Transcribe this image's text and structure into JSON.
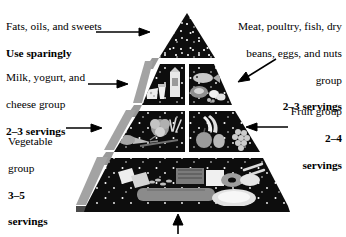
{
  "diagram": {
    "name": "Food Guide Pyramid",
    "tiers": 4,
    "background_color": "#ffffff",
    "pyramid_fill": "#0d0d0d",
    "bevel_color": "#9a9a9a",
    "divider_color": "#ffffff"
  },
  "labels": {
    "fats": {
      "line1": "Fats, oils, and sweets",
      "line2": "Use sparingly",
      "arrow": "arrow-right"
    },
    "milk": {
      "line1": "Milk, yogurt, and",
      "line2": "cheese group",
      "line3": "2–3 servings",
      "arrow": "arrow-right"
    },
    "vegetable": {
      "line1": "Vegetable",
      "line2": "group",
      "line3": "3–5",
      "line4": "servings",
      "arrow": "arrow-right"
    },
    "meat": {
      "line1": "Meat, poultry, fish, dry",
      "line2": "beans, eggs, and nuts",
      "line3": "group",
      "line4": "2–3 servings",
      "arrow": "arrow-diagonal-down-left"
    },
    "fruit": {
      "line1": "Fruit group",
      "line2": "2–4",
      "line3": "servings",
      "arrow": "arrow-left"
    },
    "base": {
      "arrow": "arrow-up"
    }
  },
  "tier_contents": {
    "apex": "fats-oils-sweets",
    "tier2_left": "milk-yogurt-cheese",
    "tier2_right": "meat-poultry-fish-beans-eggs-nuts",
    "tier3_left": "vegetables",
    "tier3_right": "fruits",
    "tier4": "bread-cereal-rice-pasta"
  }
}
